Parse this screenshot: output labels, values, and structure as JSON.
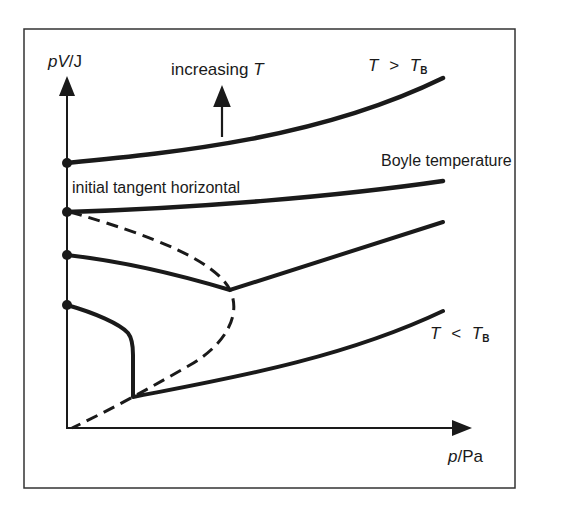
{
  "diagram": {
    "type": "pV vs p isotherms for a real gas",
    "y_axis_label": {
      "var": "pV",
      "unit": "/J"
    },
    "x_axis_label": {
      "var": "p",
      "unit": "/Pa"
    },
    "annotations": {
      "increasing_T": {
        "text": "increasing ",
        "var": "T"
      },
      "above_boyle": {
        "T": "T",
        "op": ">",
        "TB": "T",
        "sub": "B"
      },
      "boyle": "Boyle temperature",
      "tangent": "initial tangent  horizontal",
      "below_boyle": {
        "T": "T",
        "op": "<",
        "TB": "T",
        "sub": "B"
      }
    },
    "curves": [
      {
        "name": "T > TB",
        "style": "solid",
        "start_dot": true
      },
      {
        "name": "Boyle temperature",
        "style": "solid",
        "start_dot": true
      },
      {
        "name": "intermediate isotherm",
        "style": "solid",
        "start_dot": true
      },
      {
        "name": "T < TB",
        "style": "solid",
        "start_dot": true
      },
      {
        "name": "minimum locus",
        "style": "dashed",
        "start_dot": false
      }
    ],
    "colors": {
      "ink": "#1a1a1a",
      "background": "#ffffff",
      "frame": "#333333"
    }
  }
}
